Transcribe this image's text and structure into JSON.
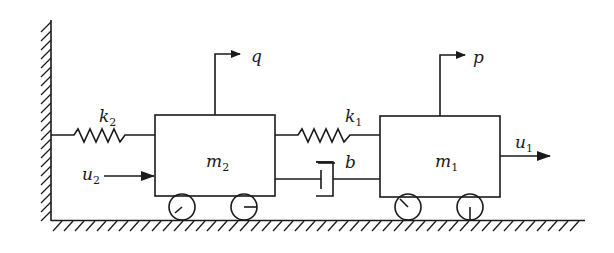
{
  "diagram": {
    "type": "two-mass spring-damper system",
    "colors": {
      "stroke": "#1a1a1a",
      "background": "#ffffff"
    },
    "masses": [
      {
        "id": "m2",
        "label": "m",
        "subscript": "2"
      },
      {
        "id": "m1",
        "label": "m",
        "subscript": "1"
      }
    ],
    "springs": [
      {
        "id": "k2",
        "label": "k",
        "subscript": "2",
        "connects": [
          "wall",
          "m2"
        ]
      },
      {
        "id": "k1",
        "label": "k",
        "subscript": "1",
        "connects": [
          "m2",
          "m1"
        ]
      }
    ],
    "damper": {
      "id": "b",
      "label": "b",
      "connects": [
        "m2",
        "m1"
      ]
    },
    "outputs": [
      {
        "id": "q",
        "label": "q",
        "from": "m2"
      },
      {
        "id": "p",
        "label": "p",
        "from": "m1"
      }
    ],
    "inputs": [
      {
        "id": "u2",
        "label": "u",
        "subscript": "2",
        "acts_on": "m2"
      },
      {
        "id": "u1",
        "label": "u",
        "subscript": "1",
        "acts_on": "m1"
      }
    ]
  }
}
